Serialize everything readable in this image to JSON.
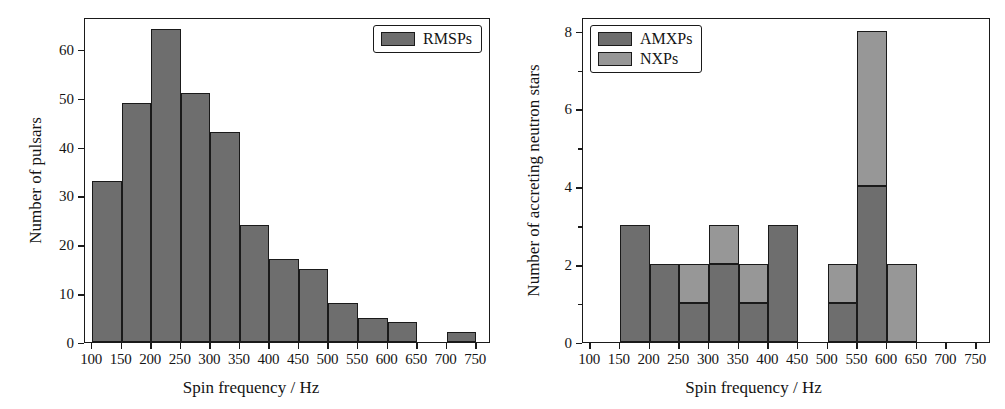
{
  "figure": {
    "panels": [
      "left",
      "right"
    ],
    "colors": {
      "amxp_dark_gray": "#6e6e6e",
      "nxp_light_gray": "#979797",
      "rmsp_gray": "#6e6e6e",
      "axis_black": "#1a1a1a",
      "background": "#ffffff"
    }
  },
  "left_panel": {
    "legend": {
      "entries": [
        {
          "label": "RMSPs",
          "color": "#6e6e6e"
        }
      ]
    },
    "xaxis": {
      "label": "Spin frequency / Hz",
      "ticks": [
        100,
        150,
        200,
        250,
        300,
        350,
        400,
        450,
        500,
        550,
        600,
        650,
        700,
        750
      ],
      "tick_labels": [
        "100",
        "150",
        "200",
        "250",
        "300",
        "350",
        "400",
        "450",
        "500",
        "550",
        "600",
        "650",
        "700",
        "750"
      ],
      "min": 88,
      "max": 775
    },
    "yaxis": {
      "label": "Number of pulsars",
      "ticks": [
        0,
        10,
        20,
        30,
        40,
        50,
        60
      ],
      "tick_labels": [
        "0",
        "10",
        "20",
        "30",
        "40",
        "50",
        "60"
      ],
      "min": 0,
      "max": 66.5
    }
  },
  "right_panel": {
    "legend": {
      "entries": [
        {
          "label": "AMXPs",
          "color": "#6e6e6e"
        },
        {
          "label": "NXPs",
          "color": "#979797"
        }
      ]
    },
    "xaxis": {
      "label": "Spin frequency / Hz",
      "ticks": [
        100,
        150,
        200,
        250,
        300,
        350,
        400,
        450,
        500,
        550,
        600,
        650,
        700,
        750
      ],
      "tick_labels": [
        "100",
        "150",
        "200",
        "250",
        "300",
        "350",
        "400",
        "450",
        "500",
        "550",
        "600",
        "650",
        "700",
        "750"
      ],
      "min": 88,
      "max": 775
    },
    "yaxis": {
      "label": "Number of accreting neutron stars",
      "ticks": [
        0,
        2,
        4,
        6,
        8
      ],
      "tick_labels": [
        "0",
        "2",
        "4",
        "6",
        "8"
      ],
      "min": 0,
      "max": 8.35
    }
  },
  "chart_data": [
    {
      "type": "bar",
      "panel": "left",
      "title": "",
      "xlabel": "Spin frequency / Hz",
      "ylabel": "Number of pulsars",
      "xlim": [
        88,
        775
      ],
      "ylim": [
        0,
        66.5
      ],
      "bin_width": 50,
      "grid": false,
      "legend_position": "top-right",
      "categories": [
        "100-150",
        "150-200",
        "200-250",
        "250-300",
        "300-350",
        "350-400",
        "400-450",
        "450-500",
        "500-550",
        "550-600",
        "600-650",
        "650-700",
        "700-750"
      ],
      "bin_edges": [
        100,
        150,
        200,
        250,
        300,
        350,
        400,
        450,
        500,
        550,
        600,
        650,
        700,
        750
      ],
      "series": [
        {
          "name": "RMSPs",
          "color": "#6e6e6e",
          "values": [
            33,
            49,
            64,
            51,
            43,
            24,
            17,
            15,
            8,
            5,
            4,
            0,
            2
          ]
        }
      ]
    },
    {
      "type": "bar",
      "panel": "right",
      "title": "",
      "xlabel": "Spin frequency / Hz",
      "ylabel": "Number of accreting neutron stars",
      "xlim": [
        88,
        775
      ],
      "ylim": [
        0,
        8.35
      ],
      "bin_width": 50,
      "grid": false,
      "stacked": true,
      "legend_position": "top-left",
      "categories": [
        "100-150",
        "150-200",
        "200-250",
        "250-300",
        "300-350",
        "350-400",
        "400-450",
        "450-500",
        "500-550",
        "550-600",
        "600-650",
        "650-700",
        "700-750"
      ],
      "bin_edges": [
        100,
        150,
        200,
        250,
        300,
        350,
        400,
        450,
        500,
        550,
        600,
        650,
        700,
        750
      ],
      "series": [
        {
          "name": "AMXPs",
          "color": "#6e6e6e",
          "values": [
            0,
            3,
            2,
            1,
            2,
            1,
            3,
            0,
            1,
            4,
            0,
            0,
            0
          ]
        },
        {
          "name": "NXPs",
          "color": "#979797",
          "values": [
            0,
            0,
            0,
            1,
            1,
            1,
            0,
            0,
            1,
            4,
            2,
            0,
            0
          ]
        }
      ]
    }
  ]
}
